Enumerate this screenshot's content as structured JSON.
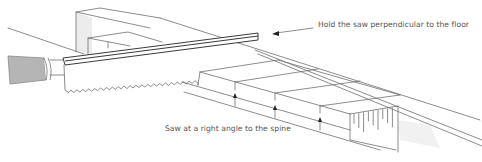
{
  "diagram": {
    "labels": {
      "perpendicular": "Hold the saw perpendicular to the floor",
      "right_angle": "Saw at a right angle to the spine"
    },
    "components": [
      "saw-handle",
      "saw-spine",
      "saw-blade-teeth",
      "back-board",
      "front-board",
      "end-grain-block",
      "cut-guide-arrows"
    ],
    "colors": {
      "line": "#6f6f6f",
      "handle_fill": "#b5b5b5",
      "shade": "#ececec",
      "text": "#555555",
      "background": "#ffffff"
    },
    "arrows": {
      "pointer_arrow_count": 1,
      "up_arrow_count": 3
    }
  }
}
